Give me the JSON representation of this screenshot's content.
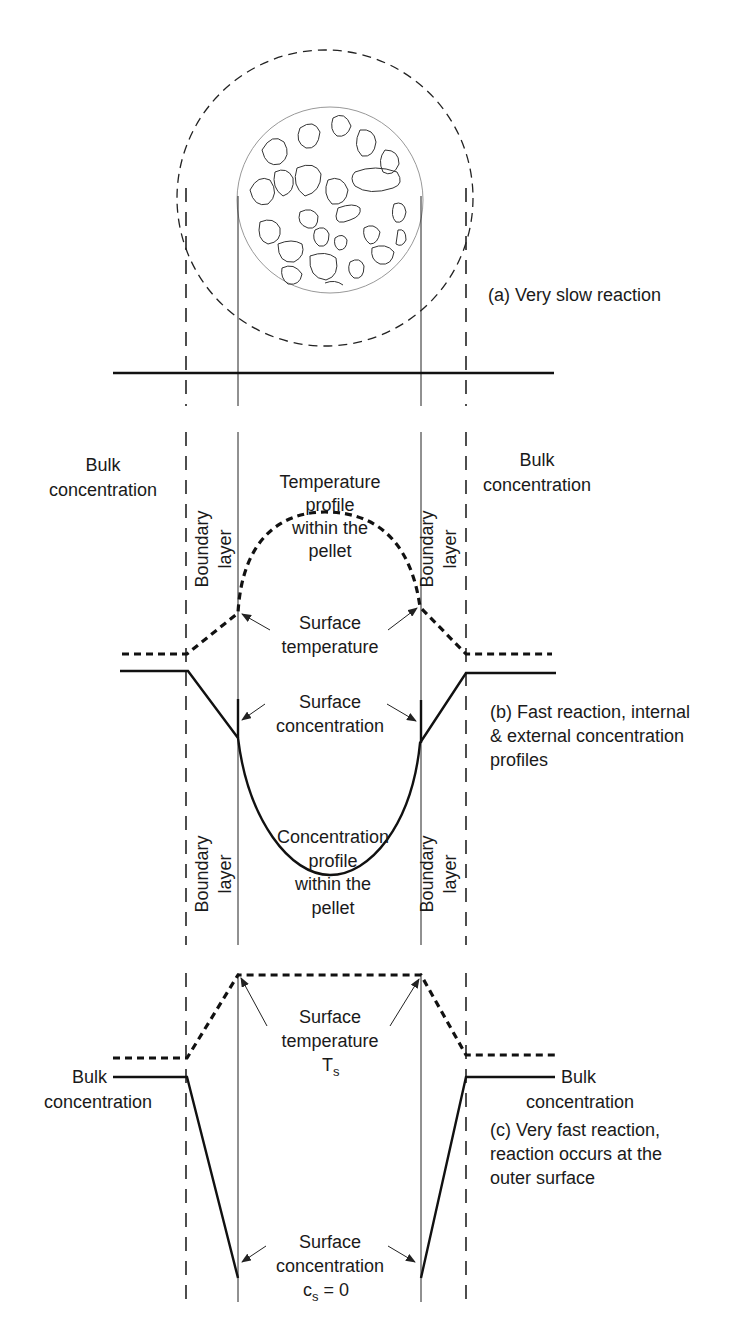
{
  "figure": {
    "panels": [
      {
        "id": "a",
        "caption": "(a) Very slow reaction"
      },
      {
        "id": "b",
        "caption_lines": [
          "(b) Fast reaction, internal",
          "& external concentration",
          "profiles"
        ],
        "labels": {
          "bulk_left": [
            "Bulk",
            "concentration"
          ],
          "bulk_right": [
            "Bulk",
            "concentration"
          ],
          "boundary_layer": [
            "Boundary",
            "layer"
          ],
          "temperature_profile": [
            "Temperature",
            "profile",
            "within the",
            "pellet"
          ],
          "surface_temperature": [
            "Surface",
            "temperature"
          ],
          "surface_concentration": [
            "Surface",
            "concentration"
          ],
          "concentration_profile": [
            "Concentration",
            "profile",
            "within the",
            "pellet"
          ]
        }
      },
      {
        "id": "c",
        "caption_lines": [
          "(c) Very fast reaction,",
          "reaction occurs at the",
          "outer surface"
        ],
        "labels": {
          "bulk_left": [
            "Bulk",
            "concentration"
          ],
          "bulk_right": [
            "Bulk",
            "concentration"
          ],
          "surface_temperature": [
            "Surface",
            "temperature",
            "T",
            "s"
          ],
          "surface_concentration": [
            "Surface",
            "concentration",
            "c",
            "s",
            " = 0"
          ]
        }
      }
    ]
  }
}
